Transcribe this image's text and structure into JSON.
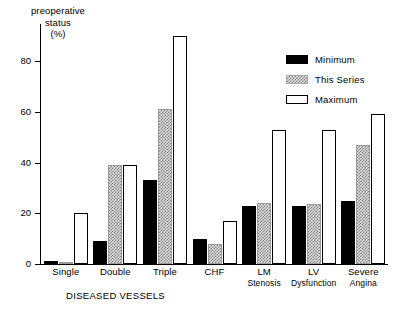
{
  "chart_data": {
    "type": "bar",
    "title": "",
    "ylabel": "preoperative status (%)",
    "ylabel_lines": [
      "preoperative",
      "status",
      "(%)"
    ],
    "xlabel": "DISEASED VESSELS",
    "ylim": [
      0,
      95
    ],
    "yticks": [
      0,
      20,
      40,
      60,
      80
    ],
    "ytick_labels": [
      "0",
      "20",
      "40",
      "60",
      "80"
    ],
    "grid": false,
    "legend_position": "upper right",
    "categories": [
      "Single",
      "Double",
      "Triple",
      "CHF",
      "LM Stenosis",
      "LV Dysfunction",
      "Severe Angina"
    ],
    "category_lines": [
      [
        "Single"
      ],
      [
        "Double"
      ],
      [
        "Triple"
      ],
      [
        "CHF"
      ],
      [
        "LM",
        "Stenosis"
      ],
      [
        "LV",
        "Dysfunction"
      ],
      [
        "Severe",
        "Angina"
      ]
    ],
    "series": [
      {
        "name": "Minimum",
        "key": "minimum",
        "color": "#000000",
        "values": [
          1,
          9,
          33,
          10,
          23,
          23,
          25
        ]
      },
      {
        "name": "This Series",
        "key": "series",
        "color": "#d9d9d9",
        "values": [
          0.5,
          39,
          61,
          8,
          24,
          23.5,
          47
        ]
      },
      {
        "name": "Maximum",
        "key": "maximum",
        "color": "#ffffff",
        "values": [
          20,
          39,
          90,
          17,
          53,
          53,
          59
        ]
      }
    ]
  },
  "legend": {
    "items": [
      {
        "label": "Minimum"
      },
      {
        "label": "This Series"
      },
      {
        "label": "Maximum"
      }
    ]
  }
}
